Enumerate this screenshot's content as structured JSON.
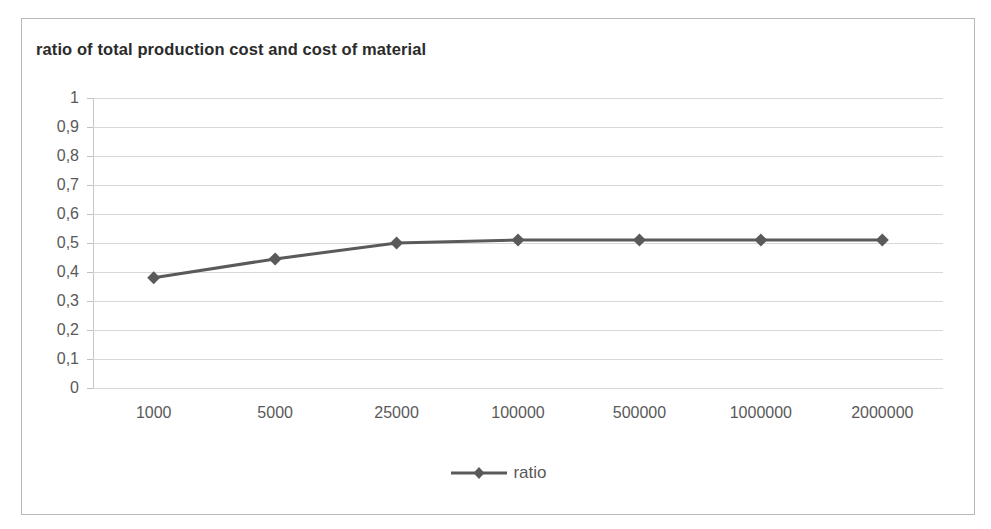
{
  "chart_data": {
    "type": "line",
    "title": "ratio of total production cost and cost of material",
    "xlabel": "",
    "ylabel": "",
    "categories": [
      "1000",
      "5000",
      "25000",
      "100000",
      "500000",
      "1000000",
      "2000000"
    ],
    "series": [
      {
        "name": "ratio",
        "values": [
          0.38,
          0.445,
          0.5,
          0.51,
          0.51,
          0.51,
          0.51
        ],
        "color": "#5a5a5a",
        "marker": "diamond"
      }
    ],
    "ylim": [
      0,
      1
    ],
    "ytick_labels": [
      "0",
      "0,1",
      "0,2",
      "0,3",
      "0,4",
      "0,5",
      "0,6",
      "0,7",
      "0,8",
      "0,9",
      "1"
    ],
    "ytick_values": [
      0,
      0.1,
      0.2,
      0.3,
      0.4,
      0.5,
      0.6,
      0.7,
      0.8,
      0.9,
      1
    ],
    "grid": true,
    "grid_color": "#d7d7d7",
    "legend": {
      "position": "bottom",
      "entries": [
        "ratio"
      ]
    },
    "plot_border_color": "#b9b9b9",
    "axis_color": "#c6c6c6",
    "text_color": "#595959"
  }
}
